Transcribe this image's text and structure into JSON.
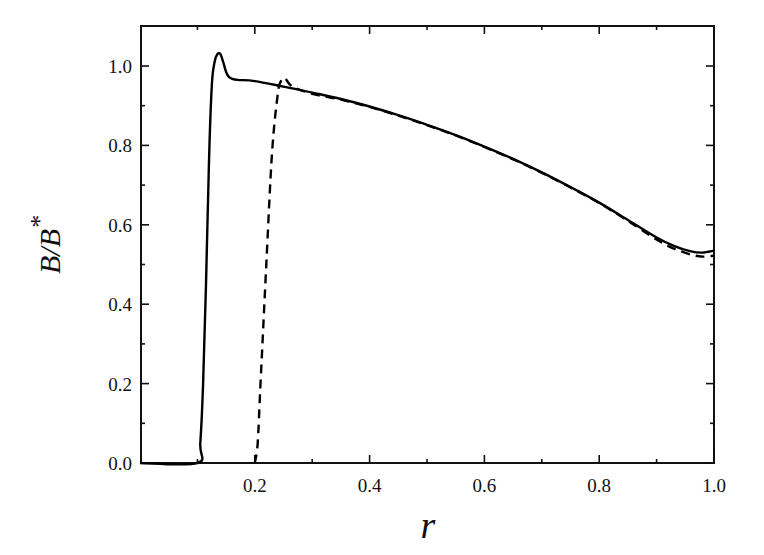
{
  "chart_data": {
    "type": "line",
    "title": "",
    "xlabel": "r",
    "ylabel": "B/B*",
    "xlim": [
      0.0,
      1.0
    ],
    "ylim": [
      0.0,
      1.1
    ],
    "x_ticks": [
      0.2,
      0.4,
      0.6,
      0.8,
      1.0
    ],
    "x_tick_labels": [
      "0.2",
      "0.4",
      "0.6",
      "0.8",
      "1.0"
    ],
    "x_minor_ticks": [
      0.1,
      0.3,
      0.5,
      0.7,
      0.9
    ],
    "y_ticks": [
      0.0,
      0.2,
      0.4,
      0.6,
      0.8,
      1.0
    ],
    "y_tick_labels": [
      "0.0",
      "0.2",
      "0.4",
      "0.6",
      "0.8",
      "1.0"
    ],
    "y_minor_ticks": [
      0.1,
      0.3,
      0.5,
      0.7,
      0.9
    ],
    "grid": false,
    "legend": null,
    "series": [
      {
        "name": "solid",
        "style": "solid",
        "color": "#000000",
        "x": [
          0.0,
          0.1,
          0.105,
          0.11,
          0.115,
          0.12,
          0.125,
          0.13,
          0.135,
          0.14,
          0.145,
          0.15,
          0.155,
          0.16,
          0.17,
          0.2,
          0.25,
          0.3,
          0.35,
          0.4,
          0.45,
          0.5,
          0.55,
          0.6,
          0.65,
          0.7,
          0.75,
          0.8,
          0.85,
          0.9,
          0.93,
          0.96,
          0.98,
          1.0
        ],
        "y": [
          0.0,
          0.0,
          0.05,
          0.2,
          0.45,
          0.75,
          0.95,
          1.01,
          1.03,
          1.03,
          1.01,
          0.985,
          0.972,
          0.968,
          0.965,
          0.962,
          0.948,
          0.933,
          0.917,
          0.898,
          0.876,
          0.852,
          0.826,
          0.797,
          0.766,
          0.732,
          0.695,
          0.656,
          0.612,
          0.568,
          0.547,
          0.533,
          0.53,
          0.535
        ]
      },
      {
        "name": "dashed",
        "style": "dashed",
        "color": "#000000",
        "x": [
          0.2,
          0.205,
          0.21,
          0.22,
          0.23,
          0.24,
          0.245,
          0.25,
          0.255,
          0.26,
          0.27,
          0.3,
          0.35,
          0.4,
          0.45,
          0.5,
          0.55,
          0.6,
          0.65,
          0.7,
          0.75,
          0.8,
          0.85,
          0.9,
          0.93,
          0.96,
          0.98,
          1.0
        ],
        "y": [
          0.0,
          0.05,
          0.2,
          0.5,
          0.78,
          0.93,
          0.96,
          0.97,
          0.965,
          0.955,
          0.945,
          0.93,
          0.915,
          0.897,
          0.875,
          0.851,
          0.825,
          0.796,
          0.765,
          0.731,
          0.694,
          0.655,
          0.61,
          0.563,
          0.54,
          0.525,
          0.52,
          0.522
        ]
      }
    ]
  },
  "labels": {
    "xlabel": "r",
    "ylabel_main": "B/B",
    "ylabel_sup": "*"
  }
}
